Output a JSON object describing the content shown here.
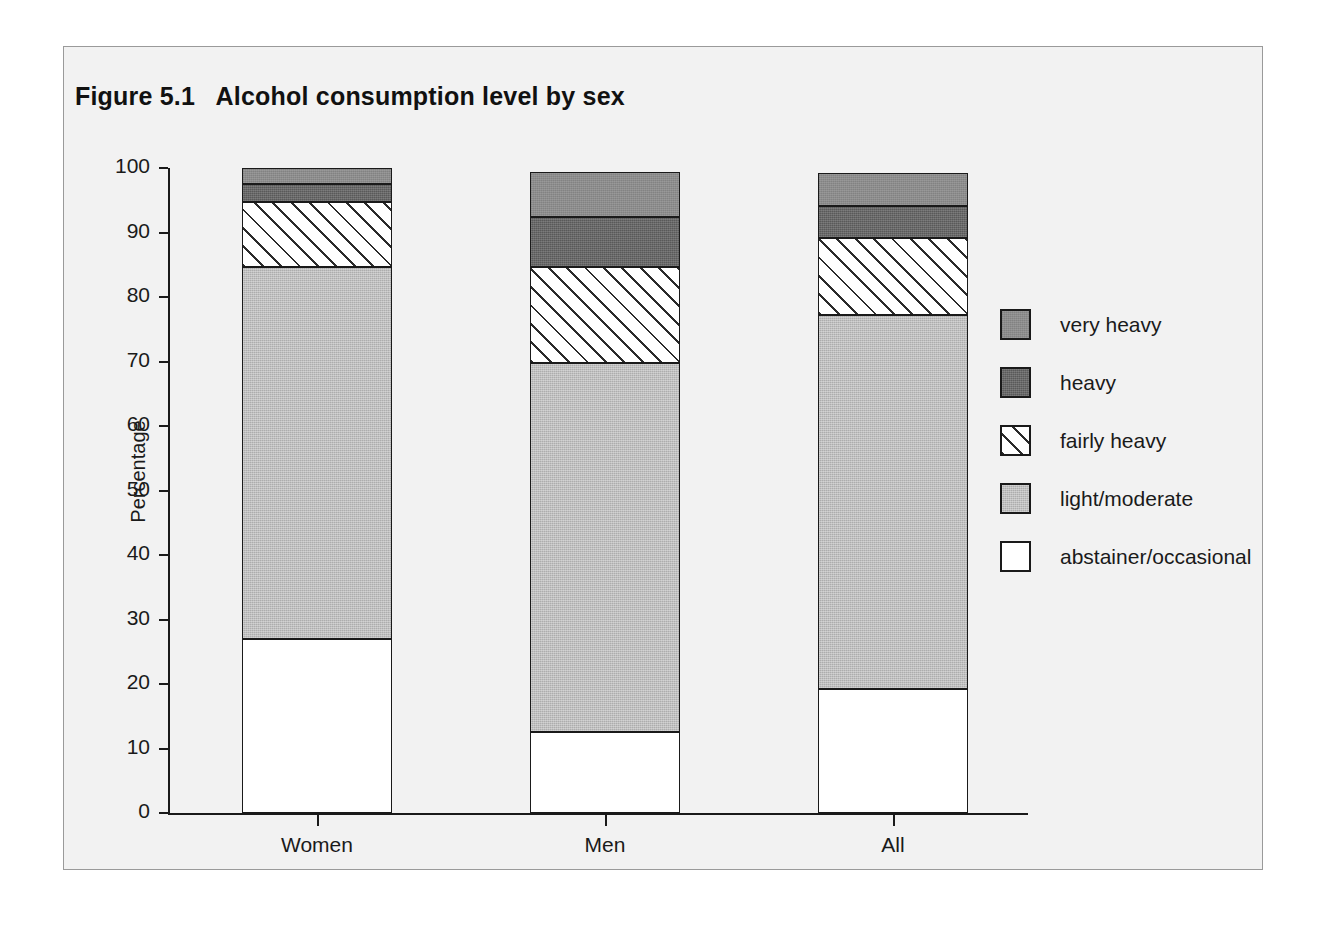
{
  "figure": {
    "title": "Figure 5.1   Alcohol consumption level by sex"
  },
  "axes": {
    "y_title": "Percentage",
    "y_ticks": [
      "100",
      "90",
      "80",
      "70",
      "60",
      "50",
      "40",
      "30",
      "20",
      "10",
      "0"
    ],
    "x_labels": [
      "Women",
      "Men",
      "All"
    ]
  },
  "legend": {
    "items": [
      {
        "label": "very heavy",
        "key": "very-heavy",
        "color": "#8c8c8c"
      },
      {
        "label": "heavy",
        "key": "heavy",
        "color": "#595959"
      },
      {
        "label": "fairly heavy",
        "key": "fairly-heavy",
        "color": "#ffffff"
      },
      {
        "label": "light/moderate",
        "key": "light-moderate",
        "color": "#adadad"
      },
      {
        "label": "abstainer/occasional",
        "key": "abstainer-occasional",
        "color": "#ffffff"
      }
    ]
  },
  "chart_data": {
    "type": "bar",
    "stacked": true,
    "title": "Figure 5.1   Alcohol consumption level by sex",
    "xlabel": "",
    "ylabel": "Percentage",
    "ylim": [
      0,
      100
    ],
    "ytick_step": 10,
    "grid": false,
    "legend_position": "right",
    "categories": [
      "Women",
      "Men",
      "All"
    ],
    "series": [
      {
        "name": "abstainer/occasional",
        "values": [
          27.0,
          12.6,
          19.2
        ]
      },
      {
        "name": "light/moderate",
        "values": [
          57.7,
          57.2,
          58.0
        ]
      },
      {
        "name": "fairly heavy",
        "values": [
          10.0,
          14.9,
          11.9
        ]
      },
      {
        "name": "heavy",
        "values": [
          2.8,
          7.7,
          5.0
        ]
      },
      {
        "name": "very heavy",
        "values": [
          2.5,
          7.0,
          5.1
        ]
      }
    ],
    "cumulative_tops": {
      "Women": [
        27.0,
        84.7,
        94.7,
        97.5,
        100.0
      ],
      "Men": [
        12.6,
        69.8,
        84.7,
        92.4,
        99.4
      ],
      "All": [
        19.2,
        77.2,
        89.1,
        94.1,
        99.2
      ]
    }
  }
}
